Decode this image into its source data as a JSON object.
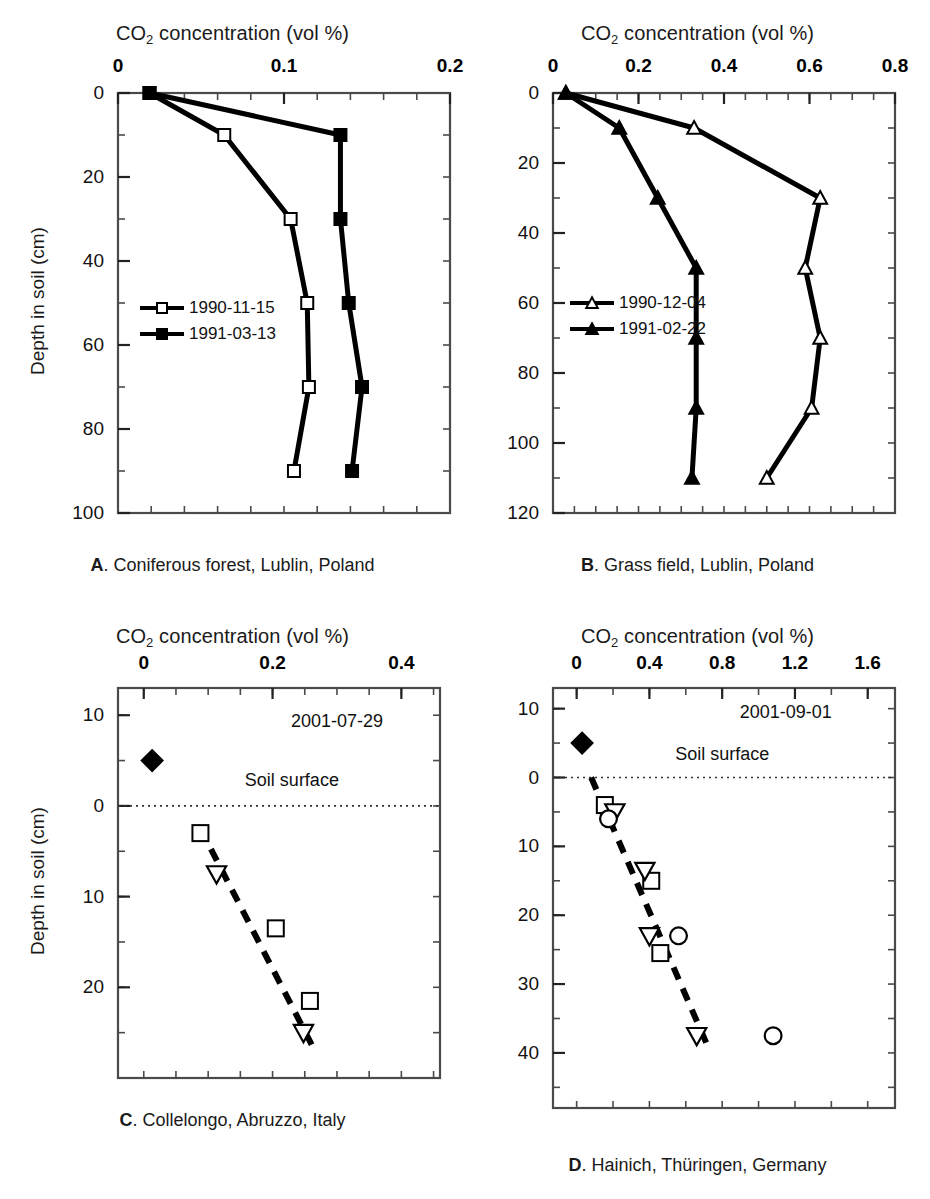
{
  "figure": {
    "axis_title": "CO2 concentration (vol %)",
    "axis_title_main": "CO",
    "axis_title_sub": "2",
    "axis_title_rest": " concentration (vol %)",
    "ylabel": "Depth in soil (cm)"
  },
  "panels": {
    "A": {
      "letter": "A",
      "caption_text": ". Coniferous forest, Lublin, Poland",
      "caption_full": "A. Coniferous forest, Lublin, Poland",
      "xlabel": "CO2 concentration (vol %)",
      "ylabel": "Depth in soil (cm)",
      "xticks": [
        "0",
        "0.1",
        "0.2"
      ],
      "xtick_values": [
        0,
        0.1,
        0.2
      ],
      "xlim": [
        0,
        0.2
      ],
      "x_minor_step": 0.02,
      "yticks": [
        "0",
        "20",
        "40",
        "60",
        "80",
        "100"
      ],
      "ytick_values": [
        0,
        20,
        40,
        60,
        80,
        100
      ],
      "ylim": [
        0,
        100
      ],
      "y_minor_step": 10,
      "legend": [
        {
          "label": "1990-11-15",
          "marker": "open-square"
        },
        {
          "label": "1991-03-13",
          "marker": "filled-square"
        }
      ]
    },
    "B": {
      "letter": "B",
      "caption_text": ". Grass field, Lublin, Poland",
      "caption_full": "B. Grass field, Lublin, Poland",
      "xlabel": "CO2 concentration (vol %)",
      "xticks": [
        "0",
        "0.2",
        "0.4",
        "0.6",
        "0.8"
      ],
      "xtick_values": [
        0,
        0.2,
        0.4,
        0.6,
        0.8
      ],
      "xlim": [
        0,
        0.8
      ],
      "x_minor_step": 0.05,
      "yticks": [
        "0",
        "20",
        "40",
        "60",
        "80",
        "100",
        "120"
      ],
      "ytick_values": [
        0,
        20,
        40,
        60,
        80,
        100,
        120
      ],
      "ylim": [
        0,
        120
      ],
      "y_minor_step": 10,
      "legend": [
        {
          "label": "1990-12-04",
          "marker": "open-triangle"
        },
        {
          "label": "1991-02-22",
          "marker": "filled-triangle"
        }
      ]
    },
    "C": {
      "letter": "C",
      "caption_text": ". Collelongo, Abruzzo, Italy",
      "caption_full": "C. Collelongo, Abruzzo, Italy",
      "xlabel": "CO2 concentration (vol %)",
      "ylabel": "Depth in soil (cm)",
      "xticks": [
        "0",
        "0.2",
        "0.4"
      ],
      "xtick_values": [
        0,
        0.2,
        0.4
      ],
      "xlim": [
        -0.04,
        0.46
      ],
      "x_minor_step": 0.05,
      "yticks": [
        "10",
        "0",
        "10",
        "20"
      ],
      "ytick_values": [
        -10,
        0,
        10,
        20
      ],
      "ylim": [
        -13,
        30
      ],
      "y_minor_step": 5,
      "date_annotation": "2001-07-29",
      "surface_label": "Soil surface",
      "surface_depth": 0
    },
    "D": {
      "letter": "D",
      "caption_text": ". Hainich, Thüringen, Germany",
      "caption_full": "D. Hainich, Thüringen, Germany",
      "xlabel": "CO2 concentration (vol %)",
      "xticks": [
        "0",
        "0.4",
        "0.8",
        "1.2",
        "1.6"
      ],
      "xtick_values": [
        0,
        0.4,
        0.8,
        1.2,
        1.6
      ],
      "xlim": [
        -0.13,
        1.75
      ],
      "x_minor_step": 0.2,
      "yticks": [
        "10",
        "0",
        "10",
        "20",
        "30",
        "40"
      ],
      "ytick_values": [
        -10,
        0,
        10,
        20,
        30,
        40
      ],
      "ylim": [
        -13,
        48
      ],
      "y_minor_step": 5,
      "date_annotation": "2001-09-01",
      "surface_label": "Soil surface",
      "surface_depth": 0
    }
  },
  "chart_data": [
    {
      "panel": "A",
      "type": "line",
      "title": "A. Coniferous forest, Lublin, Poland",
      "xlabel": "CO2 concentration (vol %)",
      "ylabel": "Depth in soil (cm)",
      "xlim": [
        0,
        0.2
      ],
      "ylim": [
        0,
        100
      ],
      "y_inverted": true,
      "grid": false,
      "legend_position": "center-left",
      "series": [
        {
          "name": "1990-11-15",
          "marker": "open-square",
          "points": [
            {
              "x": 0.019,
              "y": 0
            },
            {
              "x": 0.064,
              "y": 10
            },
            {
              "x": 0.104,
              "y": 30
            },
            {
              "x": 0.114,
              "y": 50
            },
            {
              "x": 0.115,
              "y": 70
            },
            {
              "x": 0.106,
              "y": 90
            }
          ]
        },
        {
          "name": "1991-03-13",
          "marker": "filled-square",
          "points": [
            {
              "x": 0.019,
              "y": 0
            },
            {
              "x": 0.134,
              "y": 10
            },
            {
              "x": 0.134,
              "y": 30
            },
            {
              "x": 0.139,
              "y": 50
            },
            {
              "x": 0.147,
              "y": 70
            },
            {
              "x": 0.141,
              "y": 90
            }
          ]
        }
      ]
    },
    {
      "panel": "B",
      "type": "line",
      "title": "B. Grass field, Lublin, Poland",
      "xlabel": "CO2 concentration (vol %)",
      "ylabel": "Depth in soil (cm)",
      "xlim": [
        0,
        0.8
      ],
      "ylim": [
        0,
        120
      ],
      "y_inverted": true,
      "grid": false,
      "legend_position": "center-left",
      "series": [
        {
          "name": "1990-12-04",
          "marker": "open-triangle",
          "points": [
            {
              "x": 0.03,
              "y": 0
            },
            {
              "x": 0.33,
              "y": 10
            },
            {
              "x": 0.625,
              "y": 30
            },
            {
              "x": 0.59,
              "y": 50
            },
            {
              "x": 0.625,
              "y": 70
            },
            {
              "x": 0.605,
              "y": 90
            },
            {
              "x": 0.5,
              "y": 110
            }
          ]
        },
        {
          "name": "1991-02-22",
          "marker": "filled-triangle",
          "points": [
            {
              "x": 0.03,
              "y": 0
            },
            {
              "x": 0.155,
              "y": 10
            },
            {
              "x": 0.245,
              "y": 30
            },
            {
              "x": 0.335,
              "y": 50
            },
            {
              "x": 0.335,
              "y": 70
            },
            {
              "x": 0.335,
              "y": 90
            },
            {
              "x": 0.325,
              "y": 110
            }
          ]
        }
      ]
    },
    {
      "panel": "C",
      "type": "scatter",
      "title": "C. Collelongo, Abruzzo, Italy",
      "xlabel": "CO2 concentration (vol %)",
      "ylabel": "Depth in soil (cm)",
      "xlim": [
        -0.04,
        0.46
      ],
      "ylim": [
        -13,
        30
      ],
      "y_inverted": true,
      "grid": false,
      "date": "2001-07-29",
      "soil_surface_line": 0,
      "series": [
        {
          "name": "atmosphere",
          "marker": "filled-diamond",
          "points": [
            {
              "x": 0.013,
              "y": -5
            }
          ]
        },
        {
          "name": "square-profile",
          "marker": "open-square",
          "points": [
            {
              "x": 0.088,
              "y": 3
            },
            {
              "x": 0.205,
              "y": 13.5
            },
            {
              "x": 0.258,
              "y": 21.5
            }
          ]
        },
        {
          "name": "triangle-profile",
          "marker": "open-triangle-down",
          "points": [
            {
              "x": 0.113,
              "y": 7.5
            },
            {
              "x": 0.248,
              "y": 25.0
            }
          ]
        }
      ],
      "trend_line": {
        "style": "dashed",
        "from": {
          "x": 0.088,
          "y": 2.5
        },
        "to": {
          "x": 0.262,
          "y": 26.5
        }
      }
    },
    {
      "panel": "D",
      "type": "scatter",
      "title": "D. Hainich, Thüringen, Germany",
      "xlabel": "CO2 concentration (vol %)",
      "ylabel": "Depth in soil (cm)",
      "xlim": [
        -0.13,
        1.75
      ],
      "ylim": [
        -13,
        48
      ],
      "y_inverted": true,
      "grid": false,
      "date": "2001-09-01",
      "soil_surface_line": 0,
      "series": [
        {
          "name": "atmosphere",
          "marker": "filled-diamond",
          "points": [
            {
              "x": 0.03,
              "y": -5
            }
          ]
        },
        {
          "name": "square-profile",
          "marker": "open-square",
          "points": [
            {
              "x": 0.155,
              "y": 4
            },
            {
              "x": 0.41,
              "y": 15
            },
            {
              "x": 0.46,
              "y": 25.5
            }
          ]
        },
        {
          "name": "triangle-profile",
          "marker": "open-triangle-down",
          "points": [
            {
              "x": 0.21,
              "y": 5
            },
            {
              "x": 0.375,
              "y": 13.5
            },
            {
              "x": 0.4,
              "y": 23
            },
            {
              "x": 0.66,
              "y": 37.5
            }
          ]
        },
        {
          "name": "circle-profile",
          "marker": "open-circle",
          "points": [
            {
              "x": 0.175,
              "y": 6
            },
            {
              "x": 0.56,
              "y": 23
            },
            {
              "x": 1.08,
              "y": 37.5
            }
          ]
        }
      ],
      "trend_line": {
        "style": "dashed",
        "from": {
          "x": 0.08,
          "y": 0
        },
        "to": {
          "x": 0.72,
          "y": 39
        }
      }
    }
  ]
}
